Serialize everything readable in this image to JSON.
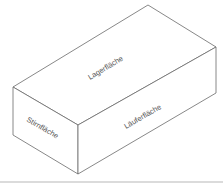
{
  "diagram": {
    "faces": [
      {
        "id": "top",
        "label": "Lagerfläche"
      },
      {
        "id": "end",
        "label": "Stirnfläche"
      },
      {
        "id": "side",
        "label": "Läuferfläche"
      }
    ]
  },
  "colors": {
    "stroke": "#6a6a6a",
    "text": "#555555",
    "rule": "#b8b8b8"
  }
}
